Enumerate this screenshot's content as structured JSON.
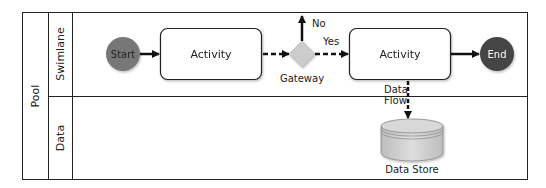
{
  "pool": {
    "label": "Pool"
  },
  "lanes": [
    {
      "label": "Swimlane"
    },
    {
      "label": "Data"
    }
  ],
  "nodes": {
    "start": {
      "label": "Start",
      "color": "#777777"
    },
    "activity1": {
      "label": "Activity"
    },
    "gateway": {
      "label": "Gateway",
      "color": "#cccccc"
    },
    "activity2": {
      "label": "Activity"
    },
    "end": {
      "label": "End",
      "color": "#444444"
    },
    "datastore": {
      "label": "Data Store",
      "color": "#cfcfcf"
    }
  },
  "edges": {
    "no": {
      "label": "No"
    },
    "yes": {
      "label": "Yes"
    },
    "dataflow": {
      "line1": "Data",
      "line2": "Flow"
    }
  }
}
